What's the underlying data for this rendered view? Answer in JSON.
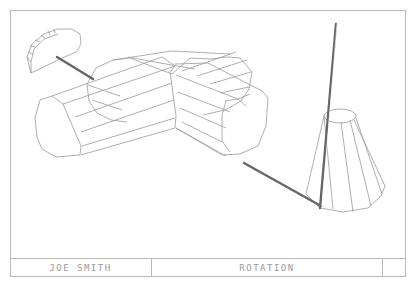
{
  "title_block": {
    "author": "JOE SMITH",
    "drawing_title": "ROTATION",
    "sheet": ""
  },
  "drawing": {
    "style": "isometric wireframe",
    "line_color": "#9a9a9a",
    "shaft_color": "#666666",
    "objects": [
      {
        "name": "half-dome",
        "description": "half-cylinder segmented dome at upper left"
      },
      {
        "name": "cross-cylinders",
        "description": "two intersecting octagonal cylinders forming a cross"
      },
      {
        "name": "truncated-cone",
        "description": "faceted truncated cone at right"
      },
      {
        "name": "shaft-left",
        "description": "rod connecting dome to cross"
      },
      {
        "name": "shaft-right",
        "description": "rod connecting cross to cone base"
      },
      {
        "name": "vertical-rod",
        "description": "tall rod rising from cone base"
      }
    ]
  }
}
